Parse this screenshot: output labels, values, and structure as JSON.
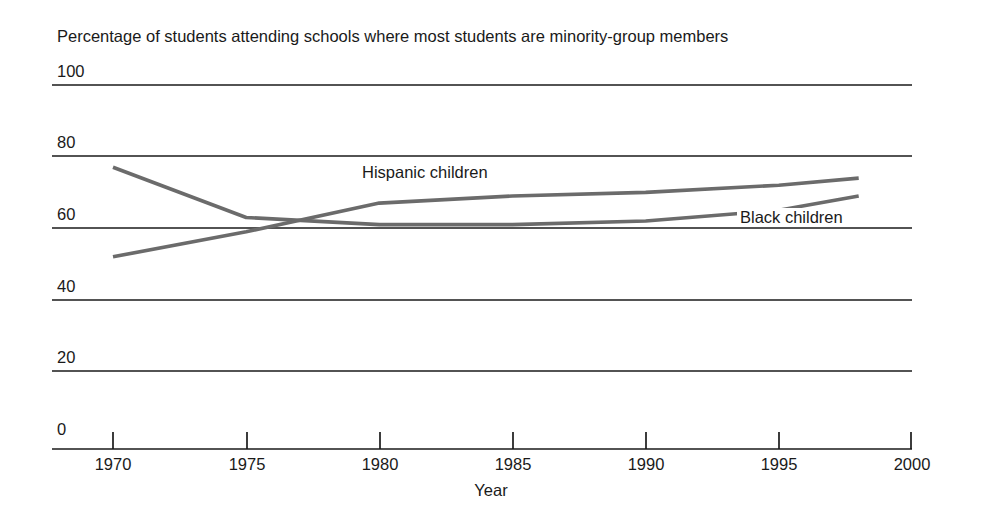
{
  "chart_data": {
    "type": "line",
    "title": "Percentage of students attending schools where most students are minority-group members",
    "xlabel": "Year",
    "ylabel": "",
    "xlim": [
      1970,
      2000
    ],
    "ylim": [
      0,
      100
    ],
    "grid": true,
    "legend_position": "inline-annotations",
    "xticks": [
      "1970",
      "1975",
      "1980",
      "1985",
      "1990",
      "1995",
      "2000"
    ],
    "yticks": [
      "0",
      "20",
      "40",
      "60",
      "80",
      "100"
    ],
    "x": [
      1970,
      1975,
      1980,
      1985,
      1990,
      1995,
      1998
    ],
    "series": [
      {
        "name": "Black children",
        "color": "#6b6b6b",
        "values": [
          77,
          63,
          61,
          61,
          62,
          65,
          69
        ]
      },
      {
        "name": "Hispanic children",
        "color": "#6b6b6b",
        "values": [
          52,
          59,
          67,
          69,
          70,
          72,
          74
        ]
      }
    ],
    "annotations": [
      {
        "text": "Hispanic children",
        "x": 1980,
        "y": 77
      },
      {
        "text": "Black children",
        "x": 1995,
        "y": 64
      }
    ]
  },
  "axis": {
    "y_ticks": [
      {
        "label": "100",
        "top": 62,
        "line_y": 85
      },
      {
        "label": "80",
        "top": 133,
        "line_y": 156
      },
      {
        "label": "60",
        "top": 205,
        "line_y": 228
      },
      {
        "label": "40",
        "top": 277,
        "line_y": 300
      },
      {
        "label": "20",
        "top": 348,
        "line_y": 371
      },
      {
        "label": "0",
        "top": 420,
        "line_y": 443
      }
    ],
    "x_ticks": [
      {
        "label": "1970",
        "x": 113
      },
      {
        "label": "1975",
        "x": 247
      },
      {
        "label": "1980",
        "x": 380
      },
      {
        "label": "1985",
        "x": 513
      },
      {
        "label": "1990",
        "x": 646
      },
      {
        "label": "1995",
        "x": 779
      },
      {
        "label": "2000",
        "x": 912
      }
    ],
    "x_title": "Year"
  },
  "style": {
    "line_color": "#6b6b6b",
    "grid_color": "#1a1a1a",
    "background": "#ffffff"
  }
}
